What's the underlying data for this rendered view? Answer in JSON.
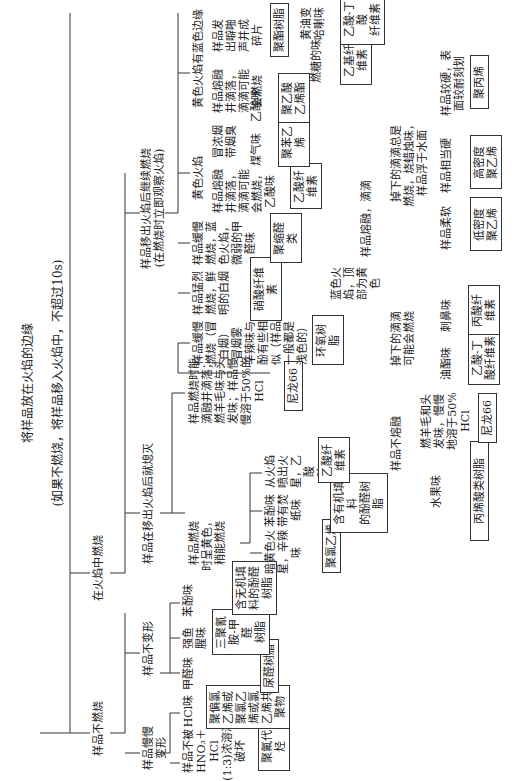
{
  "title": {
    "main": "将样品放在火焰的边缘",
    "sub": "(如果不燃烧，将样品移入火焰中，不超过10s)"
  },
  "branches": {
    "no_burn": {
      "label": "样品不燃烧",
      "slow_deform": {
        "label": "样品慢慢变形",
        "a": {
          "cond": "样品不被\nHNO₃＋HCl\n(1:3)浓溶液\n破坏",
          "result": "聚氟代烃"
        },
        "b": {
          "cond": "HCl味",
          "result": "聚偏氯\n乙烯或\n聚氯乙\n烯或氯\n乙烯共\n聚物"
        }
      },
      "no_deform": {
        "label": "样品不变形",
        "a": {
          "cond": "甲醛味",
          "result": "尿醛树脂"
        },
        "b": {
          "cond": "强鱼\n腥味",
          "result": "三聚氰\n胺-甲醛\n树脂"
        },
        "c": {
          "cond": "苯酚味",
          "result": "含无机填\n料的酚醛\n树脂"
        }
      }
    },
    "burn_in_flame": {
      "label": "在火焰中燃烧",
      "extinguish": {
        "label": "样品在移出火焰后就熄灭",
        "yellow": {
          "label": "样品燃烧\n时呈黄色，\n稍能燃烧",
          "a": {
            "cond": "暗黄色火\n星，辛辣\n味",
            "result": "聚氯乙烯"
          },
          "b": {
            "cond": "苯酚味\n带有焚\n纸味",
            "result": "含有机填料\n的酚醛树脂"
          },
          "c": {
            "cond": "从火焰\n喷出火\n星，乙酸\n味",
            "result": "乙酸纤维素"
          }
        },
        "drip": {
          "cond": "样品燃烧时能\n滴融并滴落；\n燃羊毛味与头\n发味；样品慢\n慢溶于50%的\nHCl",
          "result": "尼龙66"
        }
      },
      "continue": {
        "label": "样品移出火焰后继续燃烧\n(在燃烧时立即观察火焰)",
        "slow_smoke": {
          "cond": "样品缓慢\n燃烧（冒\n白烟）\n冒烟雾\n辛辣味与\n酚有些相\n似（样品\n一般都是\n浅色的）",
          "result": "环氧树脂"
        },
        "violent": {
          "cond": "样品猛烈\n燃烧，鲜\n明的白烟",
          "result": "硝酸纤维素"
        },
        "blue_slow": {
          "cond": "样品缓慢\n燃烧，蓝\n色火焰，\n微弱的甲\n醛味",
          "result": "聚缩醛类"
        },
        "yellow_flame": {
          "label": "黄色火焰",
          "a": {
            "cond": "样品熔融\n并滴落，\n滴滴可能\n会燃烧，\n乙酸味",
            "result": "乙酸纤\n维素"
          },
          "b": {
            "cond": "冒浓烟\n带烟臭",
            "c1": {
              "cond": "煤气味",
              "result": "聚苯乙烯"
            },
            "c2": {
              "cond": "乙酸味",
              "result": "聚乙酸\n乙烯酯"
            }
          }
        },
        "yellow_blue_edge": {
          "label": "黄色火焰有蓝色边缘",
          "a": {
            "cond": "样品熔融\n并滴落，\n滴滴可能\n会燃烧",
            "c1": {
              "cond": "燃糖的味",
              "result": "乙基纤维素"
            },
            "c2": {
              "cond": "黄油变哈喇味",
              "result": "乙酸-丁酸\n纤维素"
            }
          },
          "b": {
            "cond": "样品发\n出噼啪\n声并成\n碎片",
            "result": "聚酯树脂"
          }
        },
        "blue_top_yellow": {
          "label": "蓝色火\n焰，顶\n部为黄\n色",
          "melt_drip": {
            "label": "样品熔融，滴滴",
            "a": {
              "cond": "掉下的滴滴\n可能会燃烧",
              "c1": {
                "cond": "油酯味",
                "result": "乙酸-丁\n酸纤维素"
              },
              "c2": {
                "cond": "刺鼻味",
                "result": "丙酸纤\n维素"
              }
            },
            "b": {
              "cond": "掉下的滴滴总是\n燃烧，烧蜡烛味，\n样品浮于水面",
              "c1": {
                "cond": "样品柔软",
                "result": "低密度\n聚乙烯"
              },
              "c2": {
                "cond": "样品相当硬",
                "result": "高密度\n聚乙烯"
              },
              "c3": {
                "cond": "样品较硬，表\n面较耐刻划",
                "result": "聚丙烯"
              }
            }
          },
          "no_melt": {
            "label": "样品不熔融",
            "a": {
              "cond": "水果味",
              "result": "丙烯酸类树脂"
            },
            "b": {
              "cond": "燃羊毛和头\n发味，慢慢\n地溶于50%\nHCl",
              "result": "尼龙66"
            }
          }
        }
      }
    }
  }
}
